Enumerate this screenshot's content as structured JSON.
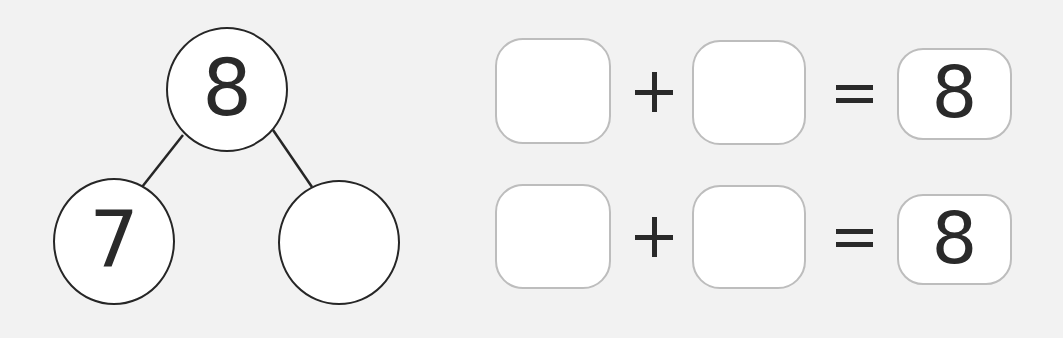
{
  "number_bond": {
    "whole": "8",
    "part_left": "7",
    "part_right": ""
  },
  "equations": [
    {
      "addend_1": "",
      "operator": "+",
      "addend_2": "",
      "equals": "=",
      "sum": "8"
    },
    {
      "addend_1": "",
      "operator": "+",
      "addend_2": "",
      "equals": "=",
      "sum": "8"
    }
  ],
  "colors": {
    "background": "#f2f2f2",
    "circle_stroke": "#262626",
    "box_stroke": "#bdbdbd",
    "text": "#2a2a2a"
  }
}
